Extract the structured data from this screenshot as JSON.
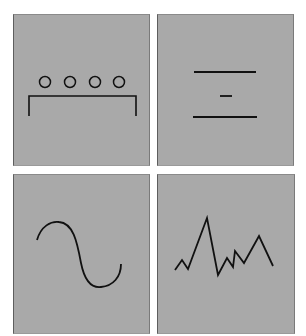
{
  "layout": {
    "rows": 2,
    "cols": 2
  },
  "colors": {
    "panel_bg": "#a9a9a9",
    "stroke": "#111111",
    "page_bg": "#ffffff"
  },
  "panels": [
    {
      "id": "circles-bracket",
      "description": "Four circles above a bracket",
      "circles": [
        {
          "cx": 44,
          "cy": 81,
          "r": 5.5
        },
        {
          "cx": 69,
          "cy": 81,
          "r": 5.5
        },
        {
          "cx": 94,
          "cy": 81,
          "r": 5.5
        },
        {
          "cx": 118,
          "cy": 81,
          "r": 5.5
        }
      ],
      "bracket": "28,115 28,95 135,95 135,115"
    },
    {
      "id": "three-lines",
      "description": "Long line, short dash, long line",
      "lines": [
        {
          "x1": 193,
          "y1": 71,
          "x2": 255,
          "y2": 71
        },
        {
          "x1": 219,
          "y1": 95,
          "x2": 231,
          "y2": 95
        },
        {
          "x1": 192,
          "y1": 116,
          "x2": 256,
          "y2": 116
        }
      ]
    },
    {
      "id": "sine-wave",
      "description": "Single smooth S-shaped sine curve",
      "path": "M36,239 C40,225 50,220 58,221 C72,222 76,240 80,262 C84,282 92,287 100,286 C112,285 120,276 120,263"
    },
    {
      "id": "zigzag",
      "description": "Jagged irregular polyline",
      "points": "174,269 181,259 187,268 206,217 217,274 226,257 232,266 234,250 243,262 258,235 272,265"
    }
  ]
}
